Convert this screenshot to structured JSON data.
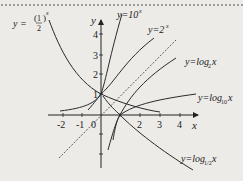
{
  "figure": {
    "type": "function-graph",
    "axes": {
      "x_label": "x",
      "y_label": "y",
      "origin_label": "0",
      "x_ticks": [
        "-2",
        "-1",
        "1",
        "2",
        "3",
        "4"
      ],
      "y_ticks": [
        "1",
        "2",
        "3",
        "4"
      ]
    },
    "curves": [
      {
        "id": "half_pow_x",
        "label_prefix": "y =",
        "label_base": "1/2",
        "label_exp": "x",
        "color": "#2a2a2a"
      },
      {
        "id": "ten_pow_x",
        "label": "y=10",
        "label_exp": "x",
        "color": "#2a2a2a"
      },
      {
        "id": "two_pow_x",
        "label": "y=2",
        "label_exp": "x",
        "color": "#2a2a2a"
      },
      {
        "id": "log2",
        "label": "y=log",
        "label_sub": "2",
        "label_var": "x",
        "color": "#2a2a2a"
      },
      {
        "id": "log10",
        "label": "y=log",
        "label_sub": "10",
        "label_var": "x",
        "color": "#2a2a2a"
      },
      {
        "id": "log_half",
        "label": "y=log",
        "label_sub": "1/2",
        "label_var": "x",
        "color": "#2a2a2a"
      }
    ],
    "reference_line": {
      "id": "y_eq_x",
      "style": "dashed"
    }
  }
}
